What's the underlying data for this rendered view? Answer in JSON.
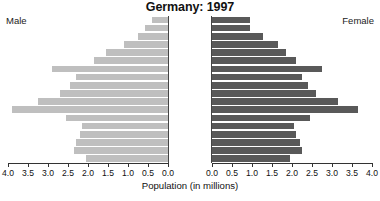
{
  "chart_data": {
    "type": "bar",
    "subtype": "population-pyramid",
    "title": "Germany: 1997",
    "xlabel": "Population (in millions)",
    "ylabel": "",
    "grid": false,
    "legend_position": "outside-top",
    "left_axis_label": "Male",
    "right_axis_label": "Female",
    "xlim_left": [
      4.0,
      0.0
    ],
    "xlim_right": [
      0.0,
      4.0
    ],
    "xticks": [
      0.0,
      0.5,
      1.0,
      1.5,
      2.0,
      2.5,
      3.0,
      3.5,
      4.0
    ],
    "xtick_labels_left": [
      "4.0",
      "3.5",
      "3.0",
      "2.5",
      "2.0",
      "1.5",
      "1.0",
      "0.5",
      "0.0"
    ],
    "xtick_labels_right": [
      "0.0",
      "0.5",
      "1.0",
      "1.5",
      "2.0",
      "2.5",
      "3.0",
      "3.5",
      "4.0"
    ],
    "categories": [
      "85+",
      "80-84",
      "75-79",
      "70-74",
      "65-69",
      "60-64",
      "55-59",
      "50-54",
      "45-49",
      "40-44",
      "35-39",
      "30-34",
      "25-29",
      "20-24",
      "15-19",
      "10-14",
      "5-9",
      "0-4"
    ],
    "series": [
      {
        "name": "Male",
        "color": "#bfbfbf",
        "values": [
          0.4,
          0.58,
          0.76,
          1.1,
          1.55,
          1.85,
          2.9,
          2.3,
          2.45,
          2.7,
          3.25,
          3.9,
          2.55,
          2.15,
          2.2,
          2.3,
          2.35,
          2.05
        ]
      },
      {
        "name": "Female",
        "color": "#595959",
        "values": [
          0.96,
          0.95,
          1.28,
          1.66,
          1.85,
          2.1,
          2.75,
          2.25,
          2.4,
          2.6,
          3.15,
          3.65,
          2.45,
          2.05,
          2.1,
          2.2,
          2.25,
          1.95
        ]
      }
    ]
  }
}
